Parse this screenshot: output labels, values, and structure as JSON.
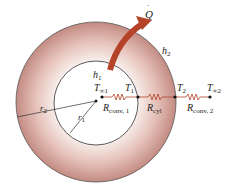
{
  "diagram": {
    "labels": {
      "heat_rate": "Q",
      "h1": "h",
      "h1_sub": "1",
      "h2": "h",
      "h2_sub": "2",
      "T_inf1": "T",
      "T_inf1_sub": "∞1",
      "T1": "T",
      "T1_sub": "1",
      "T2": "T",
      "T2_sub": "2",
      "T_inf2": "T",
      "T_inf2_sub": "∞2",
      "R_conv1": "R",
      "R_conv1_sub": "conv, 1",
      "R_cyl": "R",
      "R_cyl_sub": "cyl",
      "R_conv2": "R",
      "R_conv2_sub": "conv, 2",
      "r1": "r",
      "r1_sub": "1",
      "r2": "r",
      "r2_sub": "2"
    },
    "colors": {
      "shell_outer": "#c9928a",
      "shell_inner": "#f4e6e2",
      "arrow": "#b5432a",
      "resistor": "#b5432a",
      "line": "#333333"
    }
  }
}
